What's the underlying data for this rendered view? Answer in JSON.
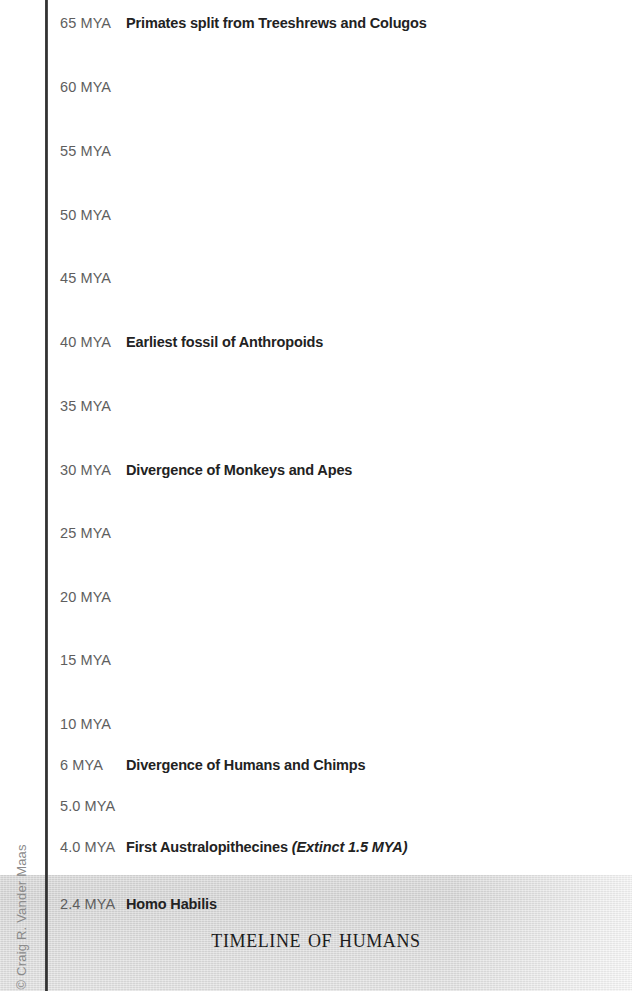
{
  "title": "Timeline of Humans",
  "credit": "© Craig R. Vander Maas",
  "axis": {
    "label_suffix": "MYA",
    "color": "#2e2e2e"
  },
  "colors": {
    "tick_label": "#5e5e5e",
    "event_text": "#222222",
    "band": "#d9d9d9",
    "background": "#ffffff"
  },
  "chart_data": {
    "type": "table",
    "title": "Timeline of Humans",
    "xlabel": "",
    "ylabel": "Millions of Years Ago (MYA)",
    "categories": [
      "65 MYA",
      "60 MYA",
      "55 MYA",
      "50 MYA",
      "45 MYA",
      "40 MYA",
      "35 MYA",
      "30 MYA",
      "25 MYA",
      "20 MYA",
      "15 MYA",
      "10 MYA",
      "6 MYA",
      "5.0 MYA",
      "4.0 MYA",
      "2.4 MYA"
    ],
    "values": [
      65,
      60,
      55,
      50,
      45,
      40,
      35,
      30,
      25,
      20,
      15,
      10,
      6,
      5.0,
      4.0,
      2.4
    ],
    "annotations": [
      "Primates split from Treeshrews and Colugos",
      "Earliest fossil of Anthropoids",
      "Divergence of Monkeys and Apes",
      "Divergence of Humans and Chimps",
      "First Australopithecines (Extinct 1.5 MYA)",
      "Homo Habilis"
    ]
  },
  "rows": [
    {
      "mya": "65 MYA",
      "event": "Primates split from Treeshrews and Colugos",
      "note": "",
      "top": 12
    },
    {
      "mya": "60 MYA",
      "event": "",
      "note": "",
      "top": 76
    },
    {
      "mya": "55 MYA",
      "event": "",
      "note": "",
      "top": 140
    },
    {
      "mya": "50 MYA",
      "event": "",
      "note": "",
      "top": 204
    },
    {
      "mya": "45 MYA",
      "event": "",
      "note": "",
      "top": 267
    },
    {
      "mya": "40 MYA",
      "event": "Earliest fossil of Anthropoids",
      "note": "",
      "top": 331
    },
    {
      "mya": "35 MYA",
      "event": "",
      "note": "",
      "top": 395
    },
    {
      "mya": "30 MYA",
      "event": "Divergence of Monkeys and Apes",
      "note": "",
      "top": 459
    },
    {
      "mya": "25 MYA",
      "event": "",
      "note": "",
      "top": 522
    },
    {
      "mya": "20 MYA",
      "event": "",
      "note": "",
      "top": 586
    },
    {
      "mya": "15 MYA",
      "event": "",
      "note": "",
      "top": 649
    },
    {
      "mya": "10 MYA",
      "event": "",
      "note": "",
      "top": 713
    },
    {
      "mya": "6 MYA",
      "event": "Divergence of Humans and Chimps",
      "note": "",
      "top": 754
    },
    {
      "mya": "5.0 MYA",
      "event": "",
      "note": "",
      "top": 795
    },
    {
      "mya": "4.0 MYA",
      "event": "First Australopithecines",
      "note": "(Extinct 1.5 MYA)",
      "top": 836
    },
    {
      "mya": "2.4 MYA",
      "event": "Homo Habilis",
      "note": "",
      "top": 893
    }
  ]
}
